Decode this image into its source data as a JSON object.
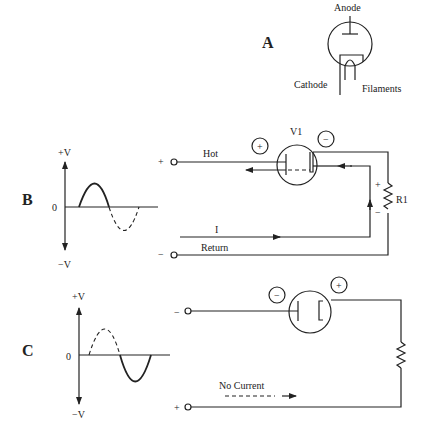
{
  "panel_a": {
    "letter": "A",
    "labels": {
      "anode": "Anode",
      "cathode": "Cathode",
      "filaments": "Filaments"
    }
  },
  "panel_b": {
    "letter": "B",
    "waveform": {
      "pos_label": "+V",
      "zero_label": "0",
      "neg_label": "−V",
      "conducting_half": "positive"
    },
    "circuit": {
      "tube_label": "V1",
      "anode_polarity": "+",
      "cathode_polarity": "−",
      "terminal_top": "+",
      "terminal_bottom": "−",
      "hot_label": "Hot",
      "return_label": "Return",
      "current_label": "I",
      "resistor_label": "R1",
      "resistor_top_polarity": "+",
      "resistor_bottom_polarity": "−"
    }
  },
  "panel_c": {
    "letter": "C",
    "waveform": {
      "pos_label": "+V",
      "zero_label": "0",
      "neg_label": "−V",
      "conducting_half": "negative"
    },
    "circuit": {
      "anode_polarity": "−",
      "cathode_polarity": "+",
      "terminal_top": "−",
      "terminal_bottom": "+",
      "current_label": "No Current"
    }
  }
}
